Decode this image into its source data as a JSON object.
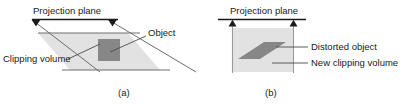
{
  "figure": {
    "background_color": "#ffffff",
    "ink_color": "#1a1a1a",
    "volume_fill_color": "#e2e2e2",
    "object_fill_color": "#878787",
    "edge_color": "#6e6e6e",
    "panels": [
      {
        "id": "a",
        "caption": "(a)",
        "labels": {
          "projection_plane": "Projection plane",
          "clipping_volume": "Clipping volume",
          "object": "Object"
        }
      },
      {
        "id": "b",
        "caption": "(b)",
        "labels": {
          "projection_plane": "Projection plane",
          "distorted_object": "Distorted object",
          "new_clipping_volume": "New clipping volume"
        }
      }
    ]
  }
}
